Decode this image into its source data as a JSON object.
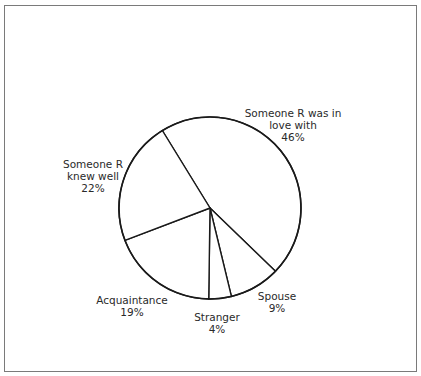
{
  "chart_data": {
    "type": "pie",
    "title": "",
    "start_angle_deg": -31.6,
    "direction": "clockwise",
    "slices": [
      {
        "label_lines": [
          "Someone R was in",
          "love with",
          "46%"
        ],
        "label": "Someone R was in love with",
        "value": 46,
        "pct_text": "46%"
      },
      {
        "label_lines": [
          "Spouse",
          "9%"
        ],
        "label": "Spouse",
        "value": 9,
        "pct_text": "9%"
      },
      {
        "label_lines": [
          "Stranger",
          "4%"
        ],
        "label": "Stranger",
        "value": 4,
        "pct_text": "4%"
      },
      {
        "label_lines": [
          "Acquaintance",
          "19%"
        ],
        "label": "Acquaintance",
        "value": 19,
        "pct_text": "19%"
      },
      {
        "label_lines": [
          "Someone R",
          "knew well",
          "22%"
        ],
        "label": "Someone R knew well",
        "value": 22,
        "pct_text": "22%"
      }
    ],
    "colors": {
      "fill": "#ffffff",
      "stroke": "#1a1a1a",
      "frame": "#7a7a7a",
      "text": "#2a2a2a"
    },
    "legend": "none; labels placed beside slices"
  },
  "layout": {
    "center": [
      210,
      208
    ],
    "radius": 91,
    "label_positions": [
      [
        293,
        113
      ],
      [
        277,
        296
      ],
      [
        217,
        317
      ],
      [
        132,
        300
      ],
      [
        93,
        164
      ]
    ],
    "line_height": 12
  }
}
